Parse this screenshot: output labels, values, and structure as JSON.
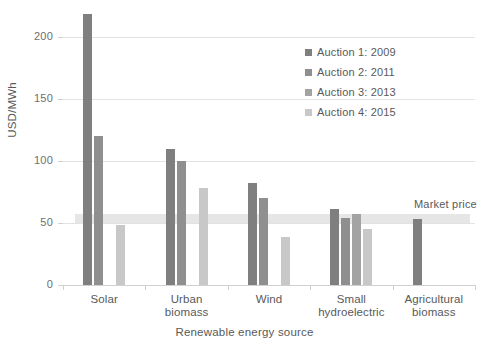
{
  "chart_data": {
    "type": "bar",
    "title": "",
    "subtitle": "",
    "xlabel": "Renewable energy source",
    "ylabel": "USD/MWh",
    "categories": [
      "Solar",
      "Urban biomass",
      "Wind",
      "Small hydroelectric",
      "Agricultural biomass"
    ],
    "category_lines": [
      [
        "Solar"
      ],
      [
        "Urban",
        "biomass"
      ],
      [
        "Wind"
      ],
      [
        "Small",
        "hydroelectric"
      ],
      [
        "Agricultural",
        "biomass"
      ]
    ],
    "series": [
      {
        "name": "Auction 1: 2009",
        "color": "#7f7f7f",
        "values": [
          218,
          110,
          82,
          61,
          53
        ]
      },
      {
        "name": "Auction 2: 2011",
        "color": "#8f8f8f",
        "values": [
          120,
          100,
          70,
          54,
          null
        ]
      },
      {
        "name": "Auction 3: 2013",
        "color": "#a3a3a3",
        "values": [
          null,
          null,
          null,
          57,
          null
        ]
      },
      {
        "name": "Auction 4: 2015",
        "color": "#c8c8c8",
        "values": [
          48,
          78,
          39,
          45,
          null
        ]
      }
    ],
    "ylim": [
      0,
      220
    ],
    "yticks": [
      0,
      50,
      100,
      150,
      200
    ],
    "ytick_labels": [
      "0",
      "50",
      "100",
      "150",
      "200"
    ],
    "grid": true,
    "legend_position": "upper right",
    "annotations": [
      {
        "label": "Market price",
        "type": "band",
        "value_low": 52,
        "value_high": 57,
        "color": "#e6e6e6"
      }
    ]
  },
  "legend": {
    "entries": [
      {
        "label": "Auction 1: 2009"
      },
      {
        "label": "Auction 2: 2011"
      },
      {
        "label": "Auction 3: 2013"
      },
      {
        "label": "Auction 4: 2015"
      }
    ]
  }
}
